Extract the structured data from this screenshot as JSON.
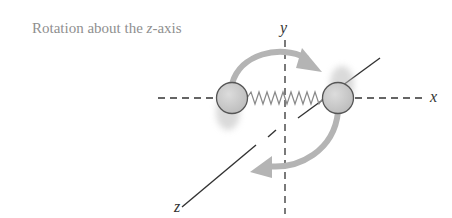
{
  "caption": {
    "prefix": "Rotation about the ",
    "axis": "z",
    "suffix": "-axis"
  },
  "axes": {
    "x": "x",
    "y": "y",
    "z": "z"
  },
  "colors": {
    "arrow": "#b4b4b4",
    "atom_fill": "#c8c8c8",
    "atom_stroke": "#555555",
    "axis": "#333333",
    "spring": "#888888",
    "caption": "#8f8f8f"
  }
}
